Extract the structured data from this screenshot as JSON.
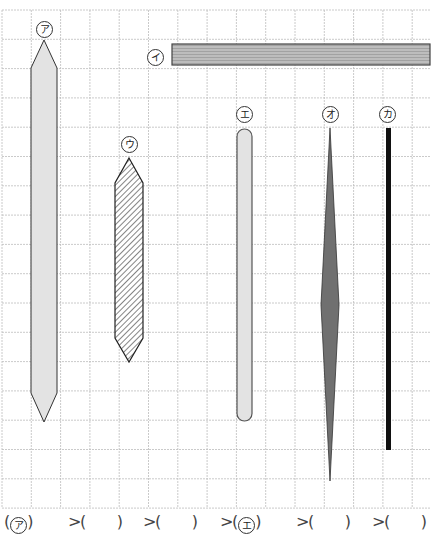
{
  "diagram": {
    "grid": {
      "x0": 2,
      "y0": 10,
      "x1": 430,
      "y1": 508,
      "cell": 29.3,
      "color": "#bdbdbd"
    },
    "items": [
      {
        "id": "a",
        "label": "ア",
        "type": "pencil",
        "fill": "#e3e3e3",
        "stroke": "#333333",
        "label_x": 33,
        "label_y": 20
      },
      {
        "id": "i",
        "label": "イ",
        "type": "bar-horizontal",
        "fill": "#b8b8b8",
        "stroke": "#444444",
        "label_x": 146,
        "label_y": 50
      },
      {
        "id": "u",
        "label": "ウ",
        "type": "pencil-hatched",
        "fill": "#ffffff",
        "stroke": "#222222",
        "label_x": 122,
        "label_y": 136
      },
      {
        "id": "e",
        "label": "エ",
        "type": "rounded-stick",
        "fill": "#e3e3e3",
        "stroke": "#555555",
        "label_x": 236,
        "label_y": 106
      },
      {
        "id": "o",
        "label": "オ",
        "type": "needle",
        "fill": "#707070",
        "stroke": "#333333",
        "label_x": 322,
        "label_y": 106
      },
      {
        "id": "ka",
        "label": "カ",
        "type": "line-thick",
        "fill": "#111111",
        "stroke": "#000000",
        "label_x": 380,
        "label_y": 106
      }
    ]
  },
  "answer": {
    "slots": [
      "ア",
      "",
      "",
      "エ",
      "",
      ""
    ],
    "separator": ">"
  }
}
